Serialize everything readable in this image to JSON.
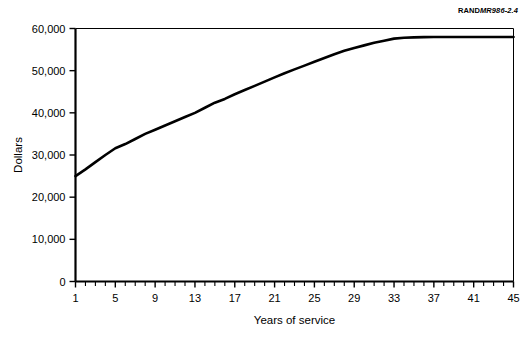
{
  "figure": {
    "source_brand": "RAND",
    "source_docid": "MR986-2.4",
    "background_color": "#ffffff",
    "line_color": "#000000"
  },
  "chart_data": {
    "type": "line",
    "title": "",
    "subtitle": "",
    "xlabel": "Years of service",
    "ylabel": "Dollars",
    "xlim": [
      1,
      45
    ],
    "ylim": [
      0,
      60000
    ],
    "grid": false,
    "legend": false,
    "legend_position": "none",
    "y_ticks": [
      0,
      10000,
      20000,
      30000,
      40000,
      50000,
      60000
    ],
    "y_tick_labels": [
      "0",
      "10,000",
      "20,000",
      "30,000",
      "40,000",
      "50,000",
      "60,000"
    ],
    "x_ticks": [
      1,
      2,
      3,
      4,
      5,
      6,
      7,
      8,
      9,
      10,
      11,
      12,
      13,
      14,
      15,
      16,
      17,
      18,
      19,
      20,
      21,
      22,
      23,
      24,
      25,
      26,
      27,
      28,
      29,
      30,
      31,
      32,
      33,
      34,
      35,
      36,
      37,
      38,
      39,
      40,
      41,
      42,
      43,
      44,
      45
    ],
    "x_tick_labels_shown": [
      1,
      5,
      9,
      13,
      17,
      21,
      25,
      29,
      33,
      37,
      41,
      45
    ],
    "x_tick_labels": [
      "1",
      "5",
      "9",
      "13",
      "17",
      "21",
      "25",
      "29",
      "33",
      "37",
      "41",
      "45"
    ],
    "x": [
      1,
      2,
      3,
      4,
      5,
      6,
      7,
      8,
      9,
      10,
      11,
      12,
      13,
      14,
      15,
      16,
      17,
      18,
      19,
      20,
      21,
      22,
      23,
      24,
      25,
      26,
      27,
      28,
      29,
      30,
      31,
      32,
      33,
      34,
      35,
      36,
      37,
      38,
      39,
      40,
      41,
      42,
      43,
      44,
      45
    ],
    "values": [
      25000,
      26600,
      28300,
      30000,
      31600,
      32600,
      33800,
      35000,
      36000,
      37000,
      38000,
      39000,
      40000,
      41200,
      42400,
      43300,
      44400,
      45400,
      46400,
      47400,
      48400,
      49400,
      50300,
      51200,
      52100,
      53000,
      53900,
      54700,
      55400,
      56000,
      56600,
      57100,
      57600,
      57800,
      57900,
      57950,
      58000,
      58000,
      58000,
      58000,
      58000,
      58000,
      58000,
      58000,
      58000
    ],
    "series": [
      {
        "name": "Dollars",
        "values": [
          25000,
          26600,
          28300,
          30000,
          31600,
          32600,
          33800,
          35000,
          36000,
          37000,
          38000,
          39000,
          40000,
          41200,
          42400,
          43300,
          44400,
          45400,
          46400,
          47400,
          48400,
          49400,
          50300,
          51200,
          52100,
          53000,
          53900,
          54700,
          55400,
          56000,
          56600,
          57100,
          57600,
          57800,
          57900,
          57950,
          58000,
          58000,
          58000,
          58000,
          58000,
          58000,
          58000,
          58000,
          58000
        ]
      }
    ]
  }
}
